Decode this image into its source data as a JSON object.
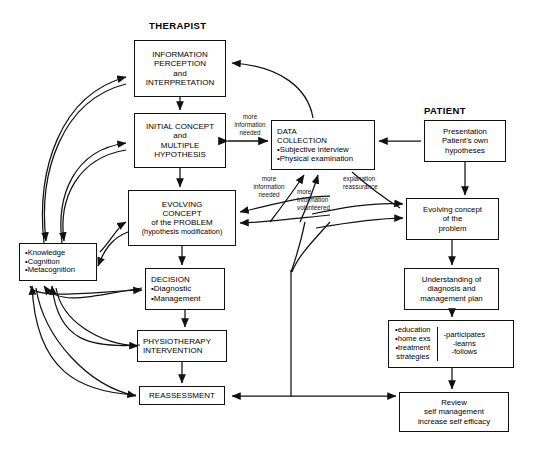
{
  "figure": {
    "title_left": "THERAPIST",
    "title_right": "PATIENT"
  },
  "therapist_column": [
    {
      "id": "information-perception",
      "lines": [
        "INFORMATION",
        "PERCEPTION",
        "and",
        "INTERPRETATION"
      ]
    },
    {
      "id": "initial-concept",
      "lines": [
        "INITIAL CONCEPT",
        "and",
        "MULTIPLE",
        "HYPOTHESIS"
      ]
    },
    {
      "id": "evolving-concept-problem",
      "lines": [
        "EVOLVING",
        "CONCEPT",
        "of the  PROBLEM",
        "(hypothesis modification)"
      ]
    },
    {
      "id": "decision",
      "lines": [
        "DECISION",
        "•Diagnostic",
        "•Management"
      ]
    },
    {
      "id": "physiotherapy-intervention",
      "lines": [
        "PHYSIOTHERAPY",
        "INTERVENTION"
      ]
    },
    {
      "id": "reassessment",
      "lines": [
        "REASSESSMENT"
      ]
    }
  ],
  "knowledge_box": {
    "id": "knowledge-cognition-metacognition",
    "lines": [
      "•Knowledge",
      "•Cognition",
      "•Metacognition"
    ]
  },
  "data_collection": {
    "id": "data-collection",
    "lines": [
      "DATA",
      "COLLECTION",
      "•Subjective interview",
      "•Physical examination"
    ]
  },
  "patient_column": [
    {
      "id": "presentation",
      "lines": [
        "Presentation",
        "Patient's own",
        "hypotheses"
      ]
    },
    {
      "id": "evolving-concept-patient",
      "lines": [
        "Evolving concept",
        "of the",
        "problem"
      ]
    },
    {
      "id": "understanding",
      "lines": [
        "Understanding of",
        "diagnosis and",
        "management plan"
      ]
    },
    {
      "id": "review",
      "lines": [
        "Review",
        "self management",
        "increase self efficacy"
      ]
    }
  ],
  "education_box": {
    "id": "education-participation",
    "left_lines": [
      "•education",
      "•home exs",
      "•treatment",
      "strategies"
    ],
    "right_lines": [
      "-participates",
      "-learns",
      "-follows"
    ]
  },
  "edge_labels": [
    {
      "id": "more-information-needed-upper",
      "lines": [
        "more",
        "information",
        "needed"
      ]
    },
    {
      "id": "more-information-needed-lower",
      "lines": [
        "more",
        "information",
        "needed"
      ]
    },
    {
      "id": "more-information-volunteered",
      "lines": [
        "more",
        "information",
        "volunteered"
      ]
    },
    {
      "id": "explanation-reassurance",
      "lines": [
        "explanation",
        "reassurance"
      ]
    }
  ],
  "colors": {
    "stroke": "#111111",
    "background": "#ffffff"
  }
}
